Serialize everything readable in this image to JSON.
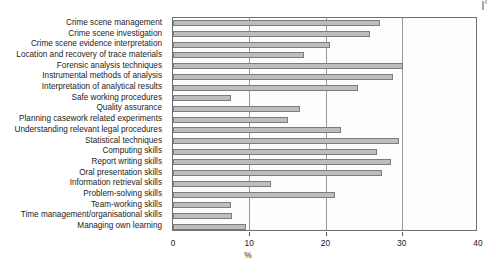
{
  "chart_data": {
    "type": "bar",
    "orientation": "horizontal",
    "title": "",
    "xlabel": "%",
    "ylabel": "",
    "xlim": [
      0,
      40
    ],
    "xticks": [
      0,
      10,
      20,
      30,
      40
    ],
    "xtick_labels": [
      "0",
      "10",
      "20",
      "30",
      "40"
    ],
    "grid": true,
    "grid_axis": "x",
    "legend": "none",
    "bar_color": "#bdbdbd",
    "bar_edge_color": "#7d7d7d",
    "categories": [
      "Crime scene management",
      "Crime scene investigation",
      "Crime scene evidence interpretation",
      "Location and recovery of trace materials",
      "Forensic analysis techniques",
      "Instrumental methods of analysis",
      "Interpretation of analytical results",
      "Safe working procedures",
      "Quality assurance",
      "Planning casework related experiments",
      "Understanding relevant legal procedures",
      "Statistical techniques",
      "Computing skills",
      "Report writing skills",
      "Oral presentation skills",
      "Information retrieval skills",
      "Problem-solving skills",
      "Team-working skills",
      "Time management/organisational skills",
      "Managing own learning"
    ],
    "values": [
      27.2,
      25.8,
      20.6,
      17.2,
      30.2,
      28.9,
      24.2,
      7.6,
      16.7,
      15.1,
      22.0,
      29.6,
      26.7,
      28.6,
      27.4,
      12.9,
      21.3,
      7.6,
      7.8,
      9.6
    ]
  },
  "axis": {
    "x_label": "%"
  }
}
